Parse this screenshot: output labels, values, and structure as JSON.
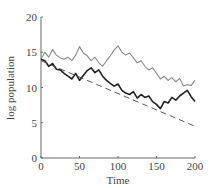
{
  "chart_data": {
    "type": "line",
    "title": "",
    "xlabel": "Time",
    "ylabel": "log population",
    "xlim": [
      0,
      200
    ],
    "ylim": [
      0,
      20
    ],
    "xticks": [
      0,
      50,
      100,
      150,
      200
    ],
    "yticks": [
      0,
      5,
      10,
      15,
      20
    ],
    "grid": false,
    "legend": null,
    "series": [
      {
        "name": "upper trajectory",
        "color": "#888888",
        "style": "solid",
        "x": [
          0,
          5,
          10,
          15,
          20,
          25,
          30,
          35,
          40,
          45,
          50,
          55,
          60,
          65,
          70,
          75,
          80,
          85,
          90,
          95,
          100,
          105,
          110,
          115,
          120,
          125,
          130,
          135,
          140,
          145,
          150,
          155,
          160,
          165,
          170,
          175,
          180,
          185,
          190,
          195,
          200
        ],
        "values": [
          14.0,
          15.0,
          14.3,
          15.4,
          14.6,
          14.2,
          14.0,
          14.3,
          13.8,
          14.6,
          15.8,
          14.9,
          14.5,
          13.8,
          14.3,
          13.5,
          13.0,
          13.8,
          14.5,
          15.3,
          15.9,
          15.0,
          14.6,
          14.9,
          14.2,
          13.5,
          13.8,
          13.0,
          12.5,
          12.8,
          12.0,
          11.2,
          11.6,
          11.0,
          11.4,
          10.8,
          11.3,
          10.2,
          10.4,
          10.3,
          11.0
        ]
      },
      {
        "name": "lower trajectory",
        "color": "#222222",
        "style": "solid",
        "x": [
          0,
          5,
          10,
          15,
          20,
          25,
          30,
          35,
          40,
          45,
          50,
          55,
          60,
          65,
          70,
          75,
          80,
          85,
          90,
          95,
          100,
          105,
          110,
          115,
          120,
          125,
          130,
          135,
          140,
          145,
          150,
          155,
          160,
          165,
          170,
          175,
          180,
          185,
          190,
          195,
          200
        ],
        "values": [
          14.0,
          13.8,
          13.0,
          13.4,
          12.6,
          12.5,
          12.0,
          11.6,
          11.2,
          12.0,
          11.0,
          11.7,
          12.4,
          12.8,
          12.1,
          12.5,
          11.6,
          11.0,
          10.6,
          10.2,
          10.5,
          9.6,
          9.2,
          9.0,
          9.4,
          8.5,
          9.0,
          8.6,
          8.8,
          8.0,
          7.6,
          7.0,
          8.0,
          7.8,
          8.6,
          8.2,
          8.8,
          9.2,
          9.6,
          8.7,
          8.0
        ]
      },
      {
        "name": "deterministic trend",
        "color": "#555555",
        "style": "dashed",
        "x": [
          0,
          200
        ],
        "values": [
          13.8,
          4.5
        ]
      }
    ]
  }
}
